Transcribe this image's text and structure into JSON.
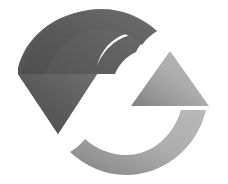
{
  "image": {
    "kind": "icon",
    "semantic_name": "refresh-sync-icon",
    "description": "Two curved arrows forming a circular rotation, one dark gray pointing down on the left and one light gray pointing up on the right",
    "width": 228,
    "height": 184,
    "background_color": "#ffffff",
    "alt_text": "Refresh / synchronize circular arrows icon"
  },
  "colors": {
    "background": "#ffffff",
    "dark_arrow": "#595959",
    "dark_arrow_light_end": "#6e6e6e",
    "dark_arrow_dark_end": "#4f4f4f",
    "light_arrow": "#adadad",
    "light_arrow_light_end": "#b9b9b9",
    "light_arrow_dark_end": "#8a8a8a",
    "transition_gray": "#7d7d7d"
  },
  "arrows": [
    {
      "id": "dark-arrow",
      "name": "counterclockwise-down-arrow",
      "tone": "dark",
      "color": "#595959",
      "direction": "down",
      "head_tip": {
        "x": 58,
        "y": 134
      },
      "head_left": {
        "x": 18,
        "y": 74
      },
      "head_right": {
        "x": 97,
        "y": 74
      },
      "arc_tail_tip": {
        "x": 157,
        "y": 31
      },
      "rotation_sense": "clockwise-sweep-top"
    },
    {
      "id": "light-arrow",
      "name": "clockwise-up-arrow",
      "tone": "light",
      "color": "#adadad",
      "direction": "up",
      "head_tip": {
        "x": 170,
        "y": 51
      },
      "head_left": {
        "x": 131,
        "y": 106
      },
      "head_right": {
        "x": 209,
        "y": 106
      },
      "arc_tail_tip": {
        "x": 70,
        "y": 152
      },
      "rotation_sense": "clockwise-sweep-bottom"
    }
  ],
  "geometry": {
    "center": {
      "x": 113,
      "y": 92
    },
    "arc_outer_radius": 78,
    "arc_inner_radius": 52,
    "arrow_head_half_width": 39,
    "shaft_half_width": 13
  }
}
